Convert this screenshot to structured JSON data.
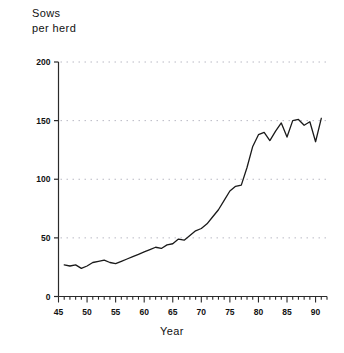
{
  "chart_data": {
    "type": "line",
    "title": "",
    "ylabel": "Sows\nper herd",
    "xlabel": "Year",
    "ylim": [
      0,
      200
    ],
    "xlim": [
      45,
      92
    ],
    "yticks": [
      0,
      50,
      100,
      150,
      200
    ],
    "ytick_labels": [
      "0",
      "50",
      "100",
      "150",
      "200"
    ],
    "xticks": [
      45,
      50,
      55,
      60,
      65,
      70,
      75,
      80,
      85,
      90
    ],
    "xtick_labels": [
      "45",
      "50",
      "55",
      "60",
      "65",
      "70",
      "75",
      "80",
      "85",
      "90"
    ],
    "x_minor_tick_interval": 1,
    "grid": "horizontal-dotted",
    "legend": "none",
    "series": [
      {
        "name": "Sows per herd",
        "x": [
          46,
          47,
          48,
          49,
          50,
          51,
          52,
          53,
          54,
          55,
          56,
          57,
          58,
          59,
          60,
          61,
          62,
          63,
          64,
          65,
          66,
          67,
          68,
          69,
          70,
          71,
          72,
          73,
          74,
          75,
          76,
          77,
          78,
          79,
          80,
          81,
          82,
          83,
          84,
          85,
          86,
          87,
          88,
          89,
          90,
          91
        ],
        "values": [
          27,
          26,
          27,
          24,
          26,
          29,
          30,
          31,
          29,
          28,
          30,
          32,
          34,
          36,
          38,
          40,
          42,
          41,
          44,
          45,
          49,
          48,
          52,
          56,
          58,
          62,
          68,
          74,
          82,
          90,
          94,
          95,
          110,
          128,
          138,
          140,
          133,
          141,
          148,
          136,
          150,
          151,
          146,
          149,
          132,
          152
        ]
      }
    ]
  },
  "axis_titles": {
    "y": "Sows\nper herd",
    "x": "Year"
  },
  "style": {
    "line_color": "#1a1a1a",
    "axis_color": "#2a2a2a",
    "grid_color": "#b9b9c4",
    "background": "#ffffff"
  }
}
